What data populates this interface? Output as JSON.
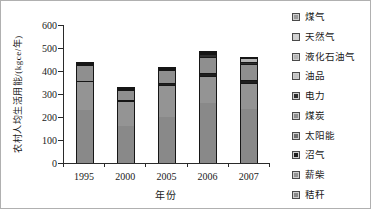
{
  "figure": {
    "y_axis": {
      "title": "农村人均生活用能/(kgce/年)",
      "ticks": [
        0,
        100,
        200,
        300,
        400,
        500,
        600
      ],
      "max": 600
    },
    "x_axis": {
      "title": "年份",
      "categories": [
        "1995",
        "2000",
        "2005",
        "2006",
        "2007"
      ]
    },
    "legend_items": [
      {
        "label": "煤气",
        "color": "#9a9a9a"
      },
      {
        "label": "天然气",
        "color": "#d2d2d2"
      },
      {
        "label": "液化石油气",
        "color": "#b5b5b5"
      },
      {
        "label": "油品",
        "color": "#c3c3c3"
      },
      {
        "label": "电力",
        "color": "#2f2f2f"
      },
      {
        "label": "煤炭",
        "color": "#8f8f8f"
      },
      {
        "label": "太阳能",
        "color": "#6e6e6e"
      },
      {
        "label": "沼气",
        "color": "#1f1f1f"
      },
      {
        "label": "薪柴",
        "color": "#949494"
      },
      {
        "label": "秸秆",
        "color": "#898989"
      }
    ]
  },
  "chart_data": {
    "type": "bar",
    "stacked": true,
    "title": "",
    "xlabel": "年份",
    "ylabel": "农村人均生活用能/(kgce/年)",
    "ylim": [
      0,
      600
    ],
    "ytick_step": 100,
    "grid": false,
    "legend_position": "right",
    "categories": [
      "1995",
      "2000",
      "2005",
      "2006",
      "2007"
    ],
    "series": [
      {
        "name": "煤气",
        "values": [
          0,
          0,
          0,
          0,
          0
        ]
      },
      {
        "name": "天然气",
        "values": [
          0,
          0,
          0,
          0,
          0
        ]
      },
      {
        "name": "液化石油气",
        "values": [
          3,
          2,
          5,
          8,
          15
        ]
      },
      {
        "name": "油品",
        "values": [
          0,
          0,
          0,
          5,
          0
        ]
      },
      {
        "name": "电力",
        "values": [
          5,
          6,
          7,
          10,
          10
        ]
      },
      {
        "name": "煤炭",
        "values": [
          72,
          45,
          55,
          70,
          70
        ]
      },
      {
        "name": "太阳能",
        "values": [
          0,
          0,
          0,
          0,
          0
        ]
      },
      {
        "name": "沼气",
        "values": [
          0,
          4,
          8,
          12,
          10
        ]
      },
      {
        "name": "薪柴",
        "values": [
          125,
          108,
          140,
          120,
          115
        ]
      },
      {
        "name": "秸秆",
        "values": [
          230,
          160,
          200,
          260,
          235
        ]
      }
    ],
    "stack_order_bottom_to_top": [
      "秸秆",
      "薪柴",
      "沼气",
      "太阳能",
      "煤炭",
      "电力",
      "油品",
      "液化石油气",
      "天然气",
      "煤气"
    ],
    "totals": [
      435,
      325,
      415,
      485,
      455
    ]
  }
}
